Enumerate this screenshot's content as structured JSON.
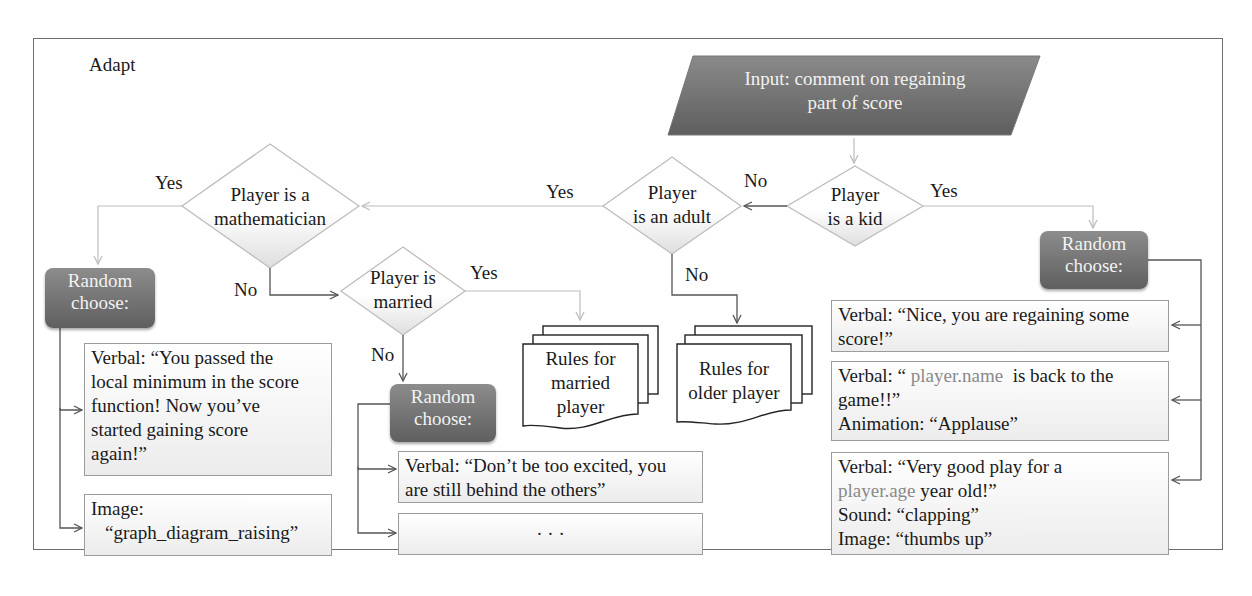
{
  "frame": {
    "title": "Adapt"
  },
  "input": {
    "line1": "Input: comment on regaining",
    "line2": "part of score"
  },
  "decisions": {
    "kid": {
      "line1": "Player",
      "line2": "is a kid",
      "yes": "Yes",
      "no": "No"
    },
    "adult": {
      "line1": "Player",
      "line2": "is an adult",
      "yes": "Yes",
      "no": "No"
    },
    "mathematician": {
      "line1": "Player is a",
      "line2": "mathematician",
      "yes": "Yes",
      "no": "No"
    },
    "married": {
      "line1": "Player is",
      "line2": "married",
      "yes": "Yes",
      "no": "No"
    }
  },
  "random": {
    "line1": "Random",
    "line2": "choose:"
  },
  "documents": {
    "married": {
      "line1": "Rules for",
      "line2": "married",
      "line3": "player"
    },
    "older": {
      "line1": "Rules for",
      "line2": "older player"
    }
  },
  "math_options": {
    "verbal": [
      "Verbal: “You passed the",
      "local minimum in the score",
      "function! Now you’ve",
      "started gaining score",
      "again!”"
    ],
    "image": [
      "Image:",
      "“graph_diagram_raising”"
    ]
  },
  "married_options": {
    "verbal": [
      "Verbal: “Don’t be too excited, you",
      "are still behind the others”"
    ],
    "more": "· · ·"
  },
  "kid_options": {
    "opt1": [
      "Verbal: “Nice, you are regaining some",
      "score!”"
    ],
    "opt2": {
      "prefix": "Verbal: “ ",
      "var": "player.name",
      "suffix": "  is back to the",
      "line2": "game!!”",
      "line3": "Animation: “Applause”"
    },
    "opt3": {
      "line1": "Verbal: “Very good play for a",
      "var": "player.age",
      "suffix": " year old!”",
      "line3": "Sound: “clapping”",
      "line4": "Image: “thumbs up”"
    }
  },
  "colors": {
    "shape_fill": "#6e6e6e",
    "light_line": "#c8c8c8",
    "dark_line": "#555555",
    "variable_text": "#8a8a8a"
  }
}
